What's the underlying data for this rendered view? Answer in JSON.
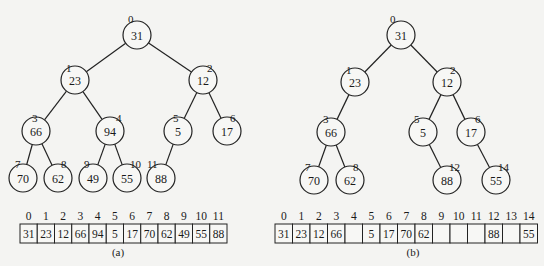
{
  "figure_a": {
    "caption": "(a)",
    "nodes": [
      {
        "index": "0",
        "value": "31",
        "x": 137,
        "y": 35,
        "ix": 128,
        "iy": 15
      },
      {
        "index": "1",
        "value": "23",
        "x": 75,
        "y": 80,
        "ix": 66,
        "iy": 64
      },
      {
        "index": "2",
        "value": "12",
        "x": 203,
        "y": 80,
        "ix": 207,
        "iy": 64
      },
      {
        "index": "3",
        "value": "66",
        "x": 36,
        "y": 131,
        "ix": 32,
        "iy": 114
      },
      {
        "index": "4",
        "value": "94",
        "x": 110,
        "y": 131,
        "ix": 116,
        "iy": 114
      },
      {
        "index": "5",
        "value": "5",
        "x": 178,
        "y": 131,
        "ix": 173,
        "iy": 114
      },
      {
        "index": "6",
        "value": "17",
        "x": 227,
        "y": 131,
        "ix": 230,
        "iy": 114
      },
      {
        "index": "7",
        "value": "70",
        "x": 23,
        "y": 178,
        "ix": 15,
        "iy": 160
      },
      {
        "index": "8",
        "value": "62",
        "x": 58,
        "y": 178,
        "ix": 61,
        "iy": 160
      },
      {
        "index": "9",
        "value": "49",
        "x": 93,
        "y": 178,
        "ix": 84,
        "iy": 160
      },
      {
        "index": "10",
        "value": "55",
        "x": 127,
        "y": 178,
        "ix": 130,
        "iy": 160
      },
      {
        "index": "11",
        "value": "88",
        "x": 161,
        "y": 178,
        "ix": 147,
        "iy": 160
      }
    ],
    "edges": [
      [
        0,
        1
      ],
      [
        0,
        2
      ],
      [
        1,
        3
      ],
      [
        1,
        4
      ],
      [
        2,
        5
      ],
      [
        2,
        6
      ],
      [
        3,
        7
      ],
      [
        3,
        8
      ],
      [
        4,
        9
      ],
      [
        4,
        10
      ],
      [
        5,
        11
      ]
    ],
    "array": {
      "x": 20,
      "y": 224,
      "cell_w": 17.25,
      "cell_h": 19,
      "indices": [
        "0",
        "1",
        "2",
        "3",
        "4",
        "5",
        "6",
        "7",
        "8",
        "9",
        "10",
        "11"
      ],
      "values": [
        "31",
        "23",
        "12",
        "66",
        "94",
        "5",
        "17",
        "70",
        "62",
        "49",
        "55",
        "88"
      ]
    }
  },
  "figure_b": {
    "caption": "(b)",
    "nodes": [
      {
        "index": "0",
        "value": "31",
        "x": 401,
        "y": 35,
        "ix": 390,
        "iy": 15
      },
      {
        "index": "1",
        "value": "23",
        "x": 355,
        "y": 82,
        "ix": 346,
        "iy": 66
      },
      {
        "index": "2",
        "value": "12",
        "x": 447,
        "y": 82,
        "ix": 450,
        "iy": 66
      },
      {
        "index": "3",
        "value": "66",
        "x": 331,
        "y": 132,
        "ix": 323,
        "iy": 115
      },
      {
        "index": "5",
        "value": "5",
        "x": 423,
        "y": 132,
        "ix": 414,
        "iy": 115
      },
      {
        "index": "6",
        "value": "17",
        "x": 471,
        "y": 132,
        "ix": 475,
        "iy": 115
      },
      {
        "index": "7",
        "value": "70",
        "x": 314,
        "y": 180,
        "ix": 305,
        "iy": 163
      },
      {
        "index": "8",
        "value": "62",
        "x": 350,
        "y": 180,
        "ix": 353,
        "iy": 163
      },
      {
        "index": "12",
        "value": "88",
        "x": 447,
        "y": 180,
        "ix": 449,
        "iy": 163
      },
      {
        "index": "14",
        "value": "55",
        "x": 496,
        "y": 180,
        "ix": 498,
        "iy": 163
      }
    ],
    "edges": [
      [
        0,
        1
      ],
      [
        0,
        2
      ],
      [
        1,
        3
      ],
      [
        2,
        4
      ],
      [
        2,
        5
      ],
      [
        3,
        6
      ],
      [
        3,
        7
      ],
      [
        4,
        8
      ],
      [
        5,
        9
      ]
    ],
    "array": {
      "x": 275,
      "y": 224,
      "cell_w": 17.5,
      "cell_h": 19,
      "indices": [
        "0",
        "1",
        "2",
        "3",
        "4",
        "5",
        "6",
        "7",
        "8",
        "9",
        "10",
        "11",
        "12",
        "13",
        "14"
      ],
      "values": [
        "31",
        "23",
        "12",
        "66",
        "",
        "5",
        "17",
        "70",
        "62",
        "",
        "",
        "",
        "88",
        "",
        "55"
      ]
    }
  },
  "style": {
    "node_radius": 14,
    "stroke": "#222222",
    "background": "#f4f4f2"
  }
}
